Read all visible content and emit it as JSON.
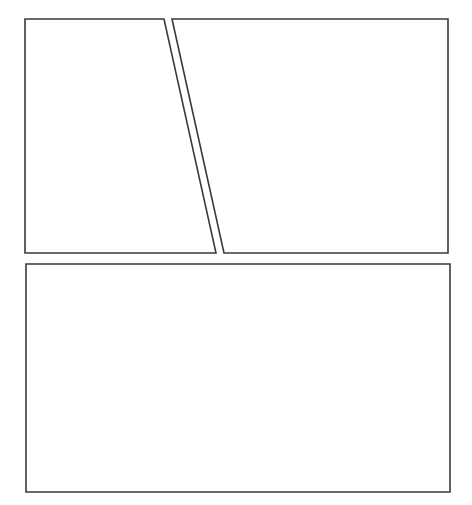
{
  "page": {
    "type": "comic-panel-layout",
    "background": "#ffffff",
    "border_color": "#3a3a3a",
    "panel_count": 3
  },
  "panels": [
    {
      "id": "panel-1",
      "position": "top-left",
      "shape": "trapezoid",
      "points": "25,19 164,19 216,253 25,253",
      "content": ""
    },
    {
      "id": "panel-2",
      "position": "top-right",
      "shape": "trapezoid",
      "points": "172,19 448,19 448,253 224,253",
      "content": ""
    },
    {
      "id": "panel-3",
      "position": "bottom",
      "shape": "rectangle",
      "points": "26,264 450,264 450,492 26,492",
      "content": ""
    }
  ]
}
